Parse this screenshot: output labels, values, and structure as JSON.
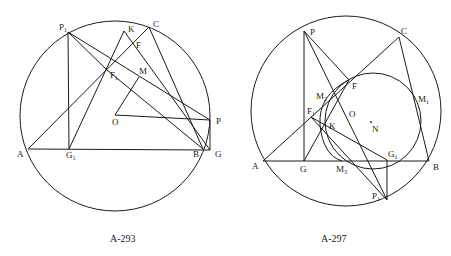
{
  "figures": [
    {
      "caption": "A-293",
      "labels": {
        "P1": "P",
        "P1_sub": "1",
        "K": "K",
        "C": "C",
        "F": "F",
        "F1": "F",
        "F1_sub": "1",
        "M": "M",
        "O": "O",
        "P": "P",
        "A": "A",
        "G1": "G",
        "G1_sub": "1",
        "B": "B",
        "G": "G"
      }
    },
    {
      "caption": "A-297",
      "labels": {
        "P": "P",
        "C": "C",
        "F": "F",
        "M2": "M",
        "M2_sub": "2",
        "M1": "M",
        "M1_sub": "1",
        "F1": "F",
        "F1_sub": "1",
        "O": "O",
        "K": "K",
        "N": "N",
        "A": "A",
        "G": "G",
        "M3": "M",
        "M3_sub": "3",
        "G1": "G",
        "G1_sub": "1",
        "B": "B",
        "P1": "P",
        "P1_sub": "1"
      }
    }
  ]
}
